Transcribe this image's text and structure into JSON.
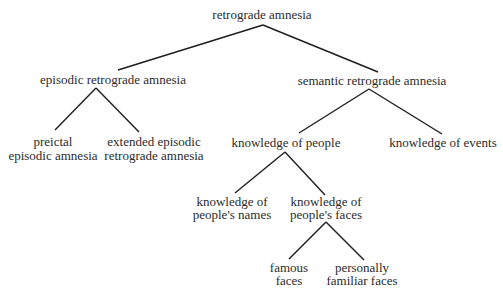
{
  "diagram": {
    "type": "tree",
    "title": "retrograde amnesia",
    "nodes": {
      "root": {
        "lines": [
          "retrograde amnesia"
        ]
      },
      "episodic": {
        "lines": [
          "episodic retrograde amnesia"
        ]
      },
      "semantic": {
        "lines": [
          "semantic retrograde amnesia"
        ]
      },
      "preictal": {
        "lines": [
          "preictal",
          "episodic amnesia"
        ]
      },
      "extended": {
        "lines": [
          "extended episodic",
          "retrograde amnesia"
        ]
      },
      "people": {
        "lines": [
          "knowledge of people"
        ]
      },
      "events": {
        "lines": [
          "knowledge of events"
        ]
      },
      "names": {
        "lines": [
          "knowledge of",
          "people's names"
        ]
      },
      "faces": {
        "lines": [
          "knowledge of",
          "people's faces"
        ]
      },
      "famous": {
        "lines": [
          "famous",
          "faces"
        ]
      },
      "familiar": {
        "lines": [
          "personally",
          "familiar faces"
        ]
      }
    },
    "edges": [
      [
        "root",
        "episodic"
      ],
      [
        "root",
        "semantic"
      ],
      [
        "episodic",
        "preictal"
      ],
      [
        "episodic",
        "extended"
      ],
      [
        "semantic",
        "people"
      ],
      [
        "semantic",
        "events"
      ],
      [
        "people",
        "names"
      ],
      [
        "people",
        "faces"
      ],
      [
        "faces",
        "famous"
      ],
      [
        "faces",
        "familiar"
      ]
    ],
    "colors": {
      "text": "#2b2b2b",
      "line": "#1e1e1e",
      "background": "#ffffff"
    }
  }
}
